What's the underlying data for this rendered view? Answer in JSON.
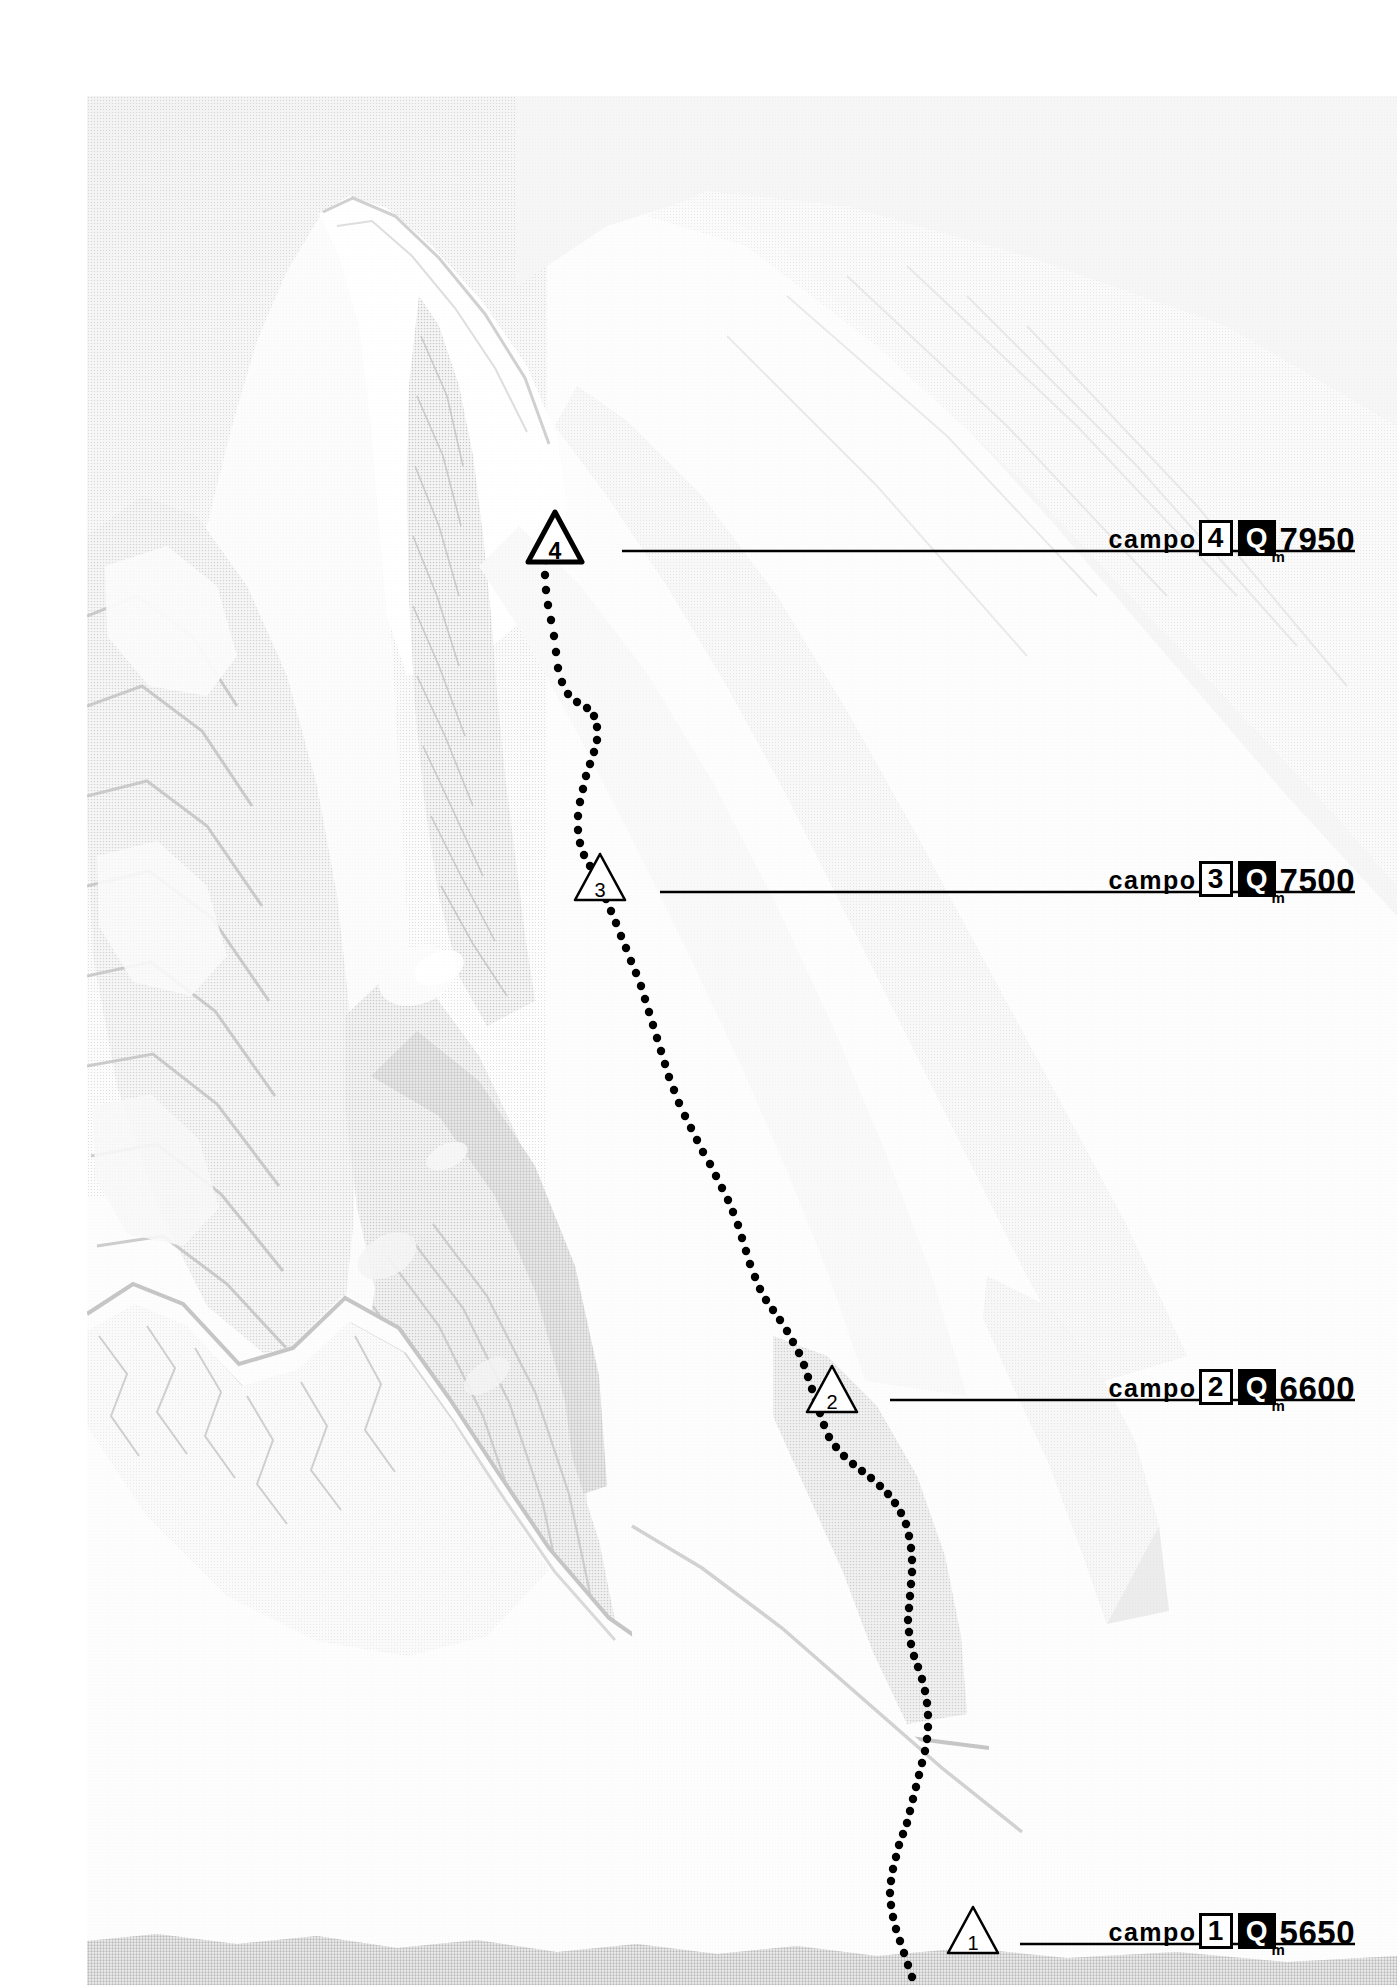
{
  "document": {
    "type": "annotated-mountain-photograph",
    "subject": "mountain ascent route diagram with numbered high camps",
    "background_color": "#ffffff",
    "ink_color": "#000000"
  },
  "photo": {
    "name": "mountain-photograph",
    "description": "black and white halftone photograph of a high snow-and-rock mountain face",
    "left": 87,
    "top": 96,
    "width": 1310,
    "height": 1889
  },
  "route": {
    "name": "ascent-route",
    "style": "dotted",
    "dot_color": "#000000",
    "dot_radius": 4.2,
    "dot_spacing": 15,
    "points": [
      [
        548,
        548
      ],
      [
        546,
        560
      ],
      [
        545,
        575
      ],
      [
        546,
        590
      ],
      [
        548,
        605
      ],
      [
        551,
        620
      ],
      [
        554,
        636
      ],
      [
        556,
        652
      ],
      [
        558,
        668
      ],
      [
        562,
        682
      ],
      [
        568,
        694
      ],
      [
        577,
        702
      ],
      [
        587,
        708
      ],
      [
        594,
        716
      ],
      [
        597,
        727
      ],
      [
        597,
        740
      ],
      [
        594,
        752
      ],
      [
        590,
        764
      ],
      [
        586,
        776
      ],
      [
        583,
        789
      ],
      [
        580,
        802
      ],
      [
        578,
        816
      ],
      [
        578,
        830
      ],
      [
        580,
        843
      ],
      [
        584,
        855
      ],
      [
        590,
        866
      ],
      [
        596,
        876
      ],
      [
        601,
        887
      ],
      [
        606,
        899
      ],
      [
        611,
        911
      ],
      [
        616,
        923
      ],
      [
        621,
        936
      ],
      [
        626,
        948
      ],
      [
        631,
        961
      ],
      [
        636,
        973
      ],
      [
        641,
        986
      ],
      [
        645,
        999
      ],
      [
        649,
        1012
      ],
      [
        653,
        1025
      ],
      [
        657,
        1038
      ],
      [
        661,
        1051
      ],
      [
        665,
        1064
      ],
      [
        669,
        1077
      ],
      [
        674,
        1090
      ],
      [
        679,
        1103
      ],
      [
        685,
        1116
      ],
      [
        691,
        1128
      ],
      [
        697,
        1140
      ],
      [
        703,
        1152
      ],
      [
        710,
        1164
      ],
      [
        716,
        1176
      ],
      [
        722,
        1188
      ],
      [
        728,
        1200
      ],
      [
        733,
        1212
      ],
      [
        738,
        1225
      ],
      [
        742,
        1238
      ],
      [
        746,
        1251
      ],
      [
        750,
        1264
      ],
      [
        755,
        1277
      ],
      [
        760,
        1289
      ],
      [
        766,
        1300
      ],
      [
        773,
        1310
      ],
      [
        780,
        1320
      ],
      [
        787,
        1331
      ],
      [
        793,
        1342
      ],
      [
        799,
        1353
      ],
      [
        804,
        1365
      ],
      [
        808,
        1377
      ],
      [
        812,
        1389
      ],
      [
        816,
        1401
      ],
      [
        820,
        1413
      ],
      [
        824,
        1425
      ],
      [
        829,
        1437
      ],
      [
        836,
        1447
      ],
      [
        844,
        1456
      ],
      [
        853,
        1464
      ],
      [
        862,
        1471
      ],
      [
        871,
        1478
      ],
      [
        880,
        1486
      ],
      [
        888,
        1494
      ],
      [
        895,
        1503
      ],
      [
        901,
        1513
      ],
      [
        906,
        1524
      ],
      [
        909,
        1536
      ],
      [
        911,
        1548
      ],
      [
        912,
        1560
      ],
      [
        912,
        1572
      ],
      [
        911,
        1584
      ],
      [
        910,
        1596
      ],
      [
        909,
        1608
      ],
      [
        908,
        1620
      ],
      [
        909,
        1632
      ],
      [
        911,
        1644
      ],
      [
        914,
        1656
      ],
      [
        918,
        1667
      ],
      [
        922,
        1679
      ],
      [
        925,
        1691
      ],
      [
        927,
        1703
      ],
      [
        928,
        1715
      ],
      [
        928,
        1727
      ],
      [
        927,
        1739
      ],
      [
        925,
        1751
      ],
      [
        922,
        1763
      ],
      [
        919,
        1775
      ],
      [
        916,
        1787
      ],
      [
        913,
        1799
      ],
      [
        910,
        1811
      ],
      [
        907,
        1823
      ],
      [
        903,
        1834
      ],
      [
        899,
        1845
      ],
      [
        896,
        1857
      ],
      [
        893,
        1869
      ],
      [
        891,
        1881
      ],
      [
        890,
        1893
      ],
      [
        891,
        1905
      ],
      [
        893,
        1917
      ],
      [
        896,
        1929
      ],
      [
        900,
        1941
      ],
      [
        904,
        1953
      ],
      [
        908,
        1965
      ],
      [
        912,
        1977
      ]
    ]
  },
  "camps": [
    {
      "id": "camp-4",
      "marker_number": "4",
      "marker_filled": true,
      "marker_x": 555,
      "marker_y": 537,
      "leader_y": 551,
      "leader_x_start": 622,
      "leader_x_end": 1355,
      "label_word": "campo",
      "label_number": "4",
      "label_q": "Q",
      "label_altitude": "7950",
      "label_unit": "m",
      "label_right": 1355
    },
    {
      "id": "camp-3",
      "marker_number": "3",
      "marker_filled": false,
      "marker_x": 600,
      "marker_y": 877,
      "leader_y": 892,
      "leader_x_start": 660,
      "leader_x_end": 1355,
      "label_word": "campo",
      "label_number": "3",
      "label_q": "Q",
      "label_altitude": "7500",
      "label_unit": "m",
      "label_right": 1355
    },
    {
      "id": "camp-2",
      "marker_number": "2",
      "marker_filled": false,
      "marker_x": 832,
      "marker_y": 1389,
      "leader_y": 1400,
      "leader_x_start": 890,
      "leader_x_end": 1355,
      "label_word": "campo",
      "label_number": "2",
      "label_q": "Q",
      "label_altitude": "6600",
      "label_unit": "m",
      "label_right": 1355
    },
    {
      "id": "camp-1",
      "marker_number": "1",
      "marker_filled": false,
      "marker_x": 973,
      "marker_y": 1930,
      "leader_y": 1944,
      "leader_x_start": 1020,
      "leader_x_end": 1355,
      "label_word": "campo",
      "label_number": "1",
      "label_q": "Q",
      "label_altitude": "5650",
      "label_unit": "m",
      "label_right": 1355
    }
  ]
}
